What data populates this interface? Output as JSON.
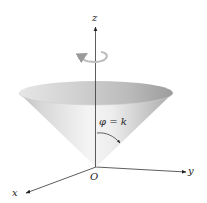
{
  "figure": {
    "labels": {
      "z_axis": "z",
      "x_axis": "x",
      "y_axis": "y",
      "origin": "O",
      "surface_equation": "φ = k"
    },
    "colors": {
      "background": "#ffffff",
      "axis": "#333333",
      "cone_light": "#f2f2f2",
      "cone_mid": "#cfcfcf",
      "cone_dark": "#9a9a9a",
      "rotation_arrow": "#bdbdbd"
    },
    "elements": [
      "z-axis",
      "x-axis",
      "y-axis",
      "cone-surface",
      "rotation-arrow",
      "angle-arrow"
    ]
  }
}
